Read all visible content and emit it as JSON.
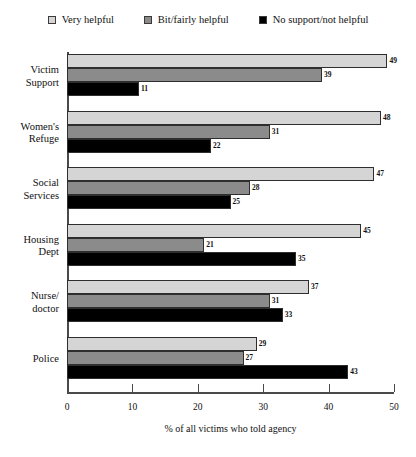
{
  "chart_data": {
    "type": "bar",
    "orientation": "horizontal",
    "grouped": true,
    "title": "",
    "xlabel": "% of all victims who told agency",
    "ylabel": "",
    "xlim": [
      0,
      50
    ],
    "xticks": [
      0,
      10,
      20,
      30,
      40,
      50
    ],
    "grid": false,
    "legend_position": "top",
    "categories": [
      "Victim Support",
      "Women's Refuge",
      "Social Services",
      "Housing Dept",
      "Nurse/ doctor",
      "Police"
    ],
    "category_lines": [
      [
        "Victim",
        "Support"
      ],
      [
        "Women's",
        "Refuge"
      ],
      [
        "Social",
        "Services"
      ],
      [
        "Housing",
        "Dept"
      ],
      [
        "Nurse/",
        "doctor"
      ],
      [
        "Police"
      ]
    ],
    "series": [
      {
        "name": "Very helpful",
        "color": "#d5d5d5",
        "values": [
          49,
          48,
          47,
          45,
          37,
          29
        ]
      },
      {
        "name": "Bit/fairly helpful",
        "color": "#8b8b8b",
        "values": [
          39,
          31,
          28,
          21,
          31,
          27
        ]
      },
      {
        "name": "No support/not helpful",
        "color": "#000000",
        "values": [
          11,
          22,
          25,
          35,
          33,
          43
        ]
      }
    ]
  },
  "legend": {
    "items": [
      {
        "label": "Very helpful",
        "color": "#d5d5d5"
      },
      {
        "label": "Bit/fairly helpful",
        "color": "#8b8b8b"
      },
      {
        "label": "No support/not helpful",
        "color": "#000000"
      }
    ]
  },
  "axis": {
    "x_title": "% of all victims who told agency",
    "x_ticks": [
      "0",
      "10",
      "20",
      "30",
      "40",
      "50"
    ]
  }
}
